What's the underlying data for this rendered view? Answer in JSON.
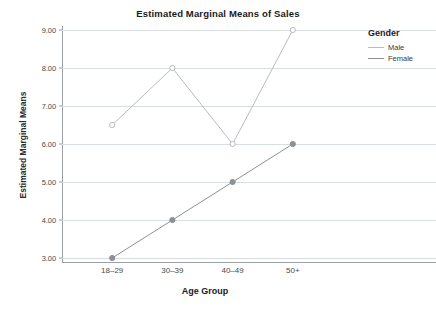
{
  "chart_data": {
    "type": "line",
    "title": "Estimated Marginal Means of Sales",
    "xlabel": "Age Group",
    "ylabel": "Estimated Marginal Means",
    "categories": [
      "18–29",
      "30–39",
      "40–49",
      "50+"
    ],
    "ylim": [
      3.0,
      9.0
    ],
    "yticks": [
      3.0,
      4.0,
      5.0,
      6.0,
      7.0,
      8.0,
      9.0
    ],
    "ytick_labels": [
      "3.00",
      "4.00",
      "5.00",
      "6.00",
      "7.00",
      "8.00",
      "9.00"
    ],
    "grid": true,
    "legend_position": "right",
    "legend_title": "Gender",
    "series": [
      {
        "name": "Male",
        "values": [
          6.5,
          8.0,
          6.0,
          9.0
        ],
        "color": "#b9bcc2",
        "marker": "open-circle"
      },
      {
        "name": "Female",
        "values": [
          3.0,
          4.0,
          5.0,
          6.0
        ],
        "color": "#8d9096",
        "marker": "filled-circle"
      }
    ]
  },
  "colors": {
    "grid": "#d8dde3",
    "axis": "#9aa0a6",
    "title_text": "#1a1a1a",
    "tick_text": "#4a4a4a",
    "background": "#ffffff"
  }
}
